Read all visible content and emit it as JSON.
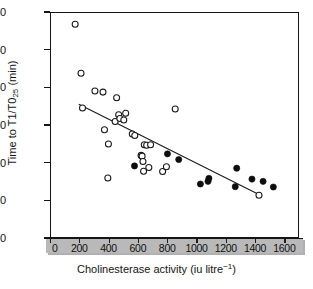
{
  "chart_data": {
    "type": "scatter",
    "title": "",
    "xlabel": "Cholinesterase activity (iu litre−1)",
    "ylabel": "Time to T1/T0₂₅ (min)",
    "xlabel_main": "Cholinesterase activity (iu litre",
    "xlabel_sup": "−1",
    "xlabel_close": ")",
    "ylabel_pre": "Time to T1/T0",
    "ylabel_sub": "25",
    "ylabel_post": " (min)",
    "xlim": [
      0,
      1700
    ],
    "ylim": [
      0,
      60
    ],
    "xticks": [
      0,
      200,
      400,
      600,
      800,
      1000,
      1200,
      1400,
      1600
    ],
    "yticks": [
      0,
      10,
      20,
      30,
      40,
      50,
      60
    ],
    "grid": false,
    "legend": "none",
    "marker_colors": {
      "open": "#ffffff",
      "open_stroke": "#1a1a1a",
      "filled": "#0d0d0d",
      "line": "#1a1a1a",
      "axis": "#151515",
      "band": "#b9b9b9"
    },
    "series": [
      {
        "name": "open circles",
        "marker": "open-circle",
        "points": [
          [
            165,
            57.0
          ],
          [
            205,
            44.0
          ],
          [
            300,
            39.3
          ],
          [
            355,
            39.0
          ],
          [
            215,
            34.8
          ],
          [
            448,
            37.5
          ],
          [
            365,
            29.0
          ],
          [
            392,
            25.2
          ],
          [
            438,
            31.2
          ],
          [
            462,
            33.0
          ],
          [
            470,
            32.0
          ],
          [
            497,
            31.6
          ],
          [
            510,
            33.4
          ],
          [
            388,
            16.2
          ],
          [
            555,
            27.9
          ],
          [
            572,
            27.5
          ],
          [
            637,
            25.0
          ],
          [
            653,
            24.9
          ],
          [
            680,
            25.0
          ],
          [
            615,
            22.2
          ],
          [
            622,
            22.0
          ],
          [
            628,
            20.6
          ],
          [
            632,
            18.0
          ],
          [
            668,
            19.0
          ],
          [
            762,
            17.9
          ],
          [
            788,
            19.2
          ],
          [
            848,
            34.5
          ],
          [
            1420,
            11.6
          ]
        ]
      },
      {
        "name": "filled circles",
        "marker": "filled-circle",
        "points": [
          [
            570,
            19.4
          ],
          [
            795,
            22.6
          ],
          [
            872,
            21.1
          ],
          [
            1020,
            14.6
          ],
          [
            1072,
            15.3
          ],
          [
            1078,
            16.1
          ],
          [
            1258,
            13.9
          ],
          [
            1268,
            18.8
          ],
          [
            1372,
            15.9
          ],
          [
            1448,
            15.3
          ],
          [
            1518,
            13.8
          ]
        ]
      }
    ],
    "trendline": {
      "name": "regression line",
      "x_start": 190,
      "y_start": 35.8,
      "x_end": 1440,
      "y_end": 11.4
    }
  }
}
